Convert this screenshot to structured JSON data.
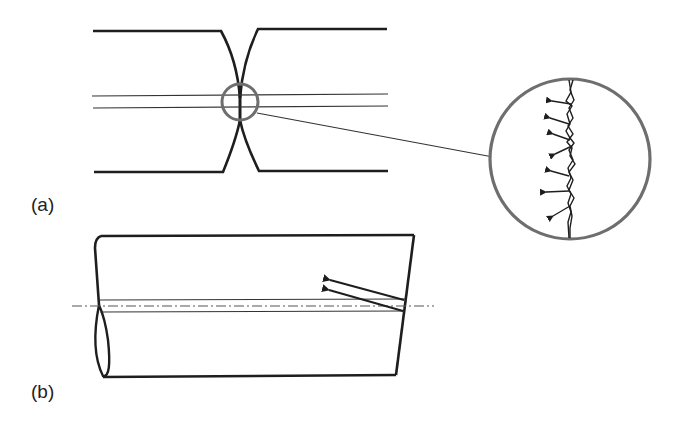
{
  "figure": {
    "panels": [
      {
        "id": "a",
        "label": "(a)",
        "description": "Necked bar cross-section with detail circle showing jagged crack with arrows"
      },
      {
        "id": "b",
        "label": "(b)",
        "description": "Cylinder with longitudinal flat band and centerline, two arrows at oblique end"
      }
    ],
    "colors": {
      "stroke": "#1e1e1e",
      "thin_stroke": "#333333",
      "detail_circle": "#6e6e6e",
      "centerline": "#555555",
      "background": "#ffffff"
    }
  }
}
